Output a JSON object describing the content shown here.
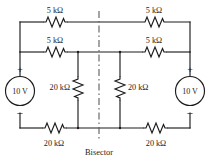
{
  "figure": {
    "bisector_label": "Bisector"
  },
  "sources": {
    "left": {
      "value": "10 V",
      "plus": "+",
      "minus": "–"
    },
    "right": {
      "value": "10 V",
      "plus": "+",
      "minus": "–"
    }
  },
  "resistors": {
    "top_left": "5 kΩ",
    "top_right": "5 kΩ",
    "mid_left": "5 kΩ",
    "mid_right": "5 kΩ",
    "vert_left": "20 kΩ",
    "vert_right": "20 kΩ",
    "bottom_left": "20 kΩ",
    "bottom_right": "20 kΩ"
  },
  "colors": {
    "wire": "#1c1c1c",
    "bisector": "#5b5b5b",
    "background": "#ffffff"
  }
}
